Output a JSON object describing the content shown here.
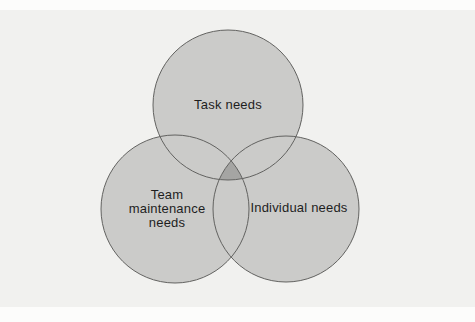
{
  "diagram": {
    "type": "venn",
    "circles": [
      {
        "id": "task-needs",
        "label": "Task needs"
      },
      {
        "id": "team-maintenance-needs",
        "label": "Team maintenance needs",
        "lines": [
          "Team",
          "maintenance",
          "needs"
        ]
      },
      {
        "id": "individual-needs",
        "label": "Individual needs"
      }
    ],
    "overlaps": {
      "triple": "Task needs + Team maintenance needs + Individual needs"
    },
    "colors": {
      "page": "#fcfcfb",
      "panel": "#f1f1ef",
      "circle_fill": "#cbcbc9",
      "circle_stroke": "#626260",
      "triple_overlap_fill": "#a5a5a3",
      "label_text": "#1e1e1e"
    }
  }
}
